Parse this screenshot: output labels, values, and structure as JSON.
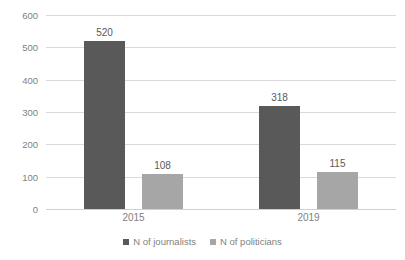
{
  "chart_data": {
    "type": "bar",
    "title": "",
    "subtitle": "",
    "xlabel": "",
    "ylabel": "",
    "categories": [
      "2015",
      "2019"
    ],
    "series": [
      {
        "name": "N of journalists",
        "values": [
          520,
          318
        ],
        "color": "#595959"
      },
      {
        "name": "N of politicians",
        "values": [
          108,
          115
        ],
        "color": "#a6a6a6"
      }
    ],
    "data_labels": [
      [
        "520",
        "318"
      ],
      [
        "108",
        "115"
      ]
    ],
    "ylim": [
      0,
      600
    ],
    "yticks": [
      0,
      100,
      200,
      300,
      400,
      500,
      600
    ],
    "ytick_labels": [
      "0",
      "100",
      "200",
      "300",
      "400",
      "500",
      "600"
    ],
    "grid": true,
    "grid_color": "#d9d9d9",
    "legend_position": "bottom",
    "background": "#ffffff",
    "axis_text_color": "#7f7f7f",
    "label_text_color": "#595959"
  }
}
